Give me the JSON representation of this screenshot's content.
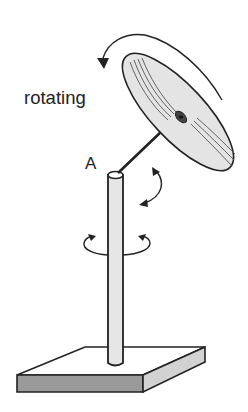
{
  "figure": {
    "labels": {
      "rotating": "rotating",
      "point_a": "A"
    },
    "components": [
      "rotating-disc",
      "connecting-rod",
      "vertical-pole",
      "square-base",
      "disc-rotation-arrow",
      "tilt-arrow",
      "pole-rotation-arrow"
    ],
    "colors": {
      "line": "#222222",
      "disc_fill": "#e4e4e4",
      "pole_fill": "#e6e6e6",
      "base_top": "#ffffff",
      "base_front": "#9a9a9a",
      "base_side": "#d2d2d2"
    }
  }
}
